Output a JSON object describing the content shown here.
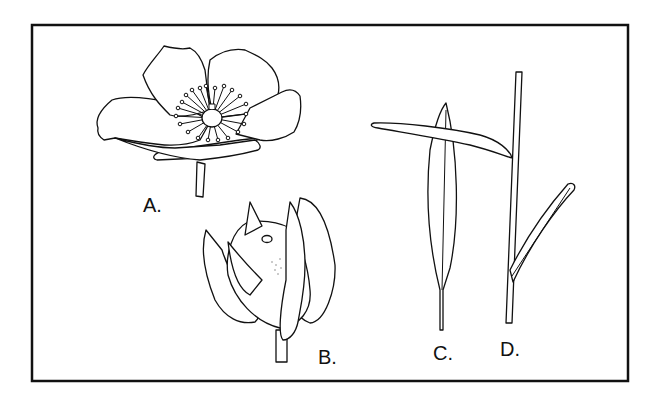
{
  "figure": {
    "frame": {
      "stroke": "#111111",
      "background": "#ffffff"
    },
    "panels": [
      {
        "id": "A",
        "label": "A.",
        "subject": "open flower with five petals and central stamens"
      },
      {
        "id": "B",
        "label": "B.",
        "subject": "fruit enclosed by sepals"
      },
      {
        "id": "C",
        "label": "C.",
        "subject": "lanceolate leaf"
      },
      {
        "id": "D",
        "label": "D.",
        "subject": "stem with narrow leaves"
      }
    ]
  }
}
